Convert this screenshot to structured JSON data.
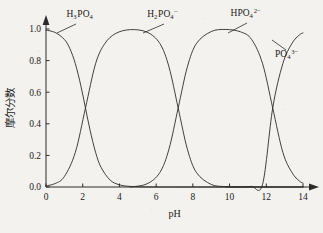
{
  "chart_data": {
    "type": "line",
    "title": "",
    "xlabel": "pH",
    "ylabel": "摩尔分数",
    "xlim": [
      0,
      14
    ],
    "ylim": [
      0.0,
      1.0
    ],
    "xticks": [
      "0",
      "2",
      "4",
      "6",
      "8",
      "10",
      "12",
      "14"
    ],
    "xtick_values": [
      0,
      2,
      4,
      6,
      8,
      10,
      12,
      14
    ],
    "yticks": [
      "0.0",
      "0.2",
      "0.4",
      "0.6",
      "0.8",
      "1.0"
    ],
    "ytick_values": [
      0.0,
      0.2,
      0.4,
      0.6,
      0.8,
      1.0
    ],
    "grid": false,
    "legend": "inline-annotations",
    "pka_values": [
      2.15,
      7.2,
      12.35
    ],
    "series": [
      {
        "name": "H₃PO₄",
        "label_html": "H<sub>3</sub>PO<sub>4</sub>",
        "x": [
          0,
          0.5,
          1.0,
          1.3,
          1.6,
          1.9,
          2.15,
          2.4,
          2.7,
          3.0,
          3.5,
          4.0,
          4.6,
          5.5,
          7.0,
          9.0,
          11.0,
          14.0
        ],
        "y": [
          0.993,
          0.978,
          0.934,
          0.876,
          0.78,
          0.64,
          0.5,
          0.36,
          0.22,
          0.124,
          0.043,
          0.014,
          0.0035,
          0.0004,
          0.0,
          0.0,
          0.0,
          0.0
        ]
      },
      {
        "name": "H₂PO₄⁻",
        "label_html": "H<sub>2</sub>PO<sub>4</sub><sup>−</sup>",
        "x": [
          0,
          0.5,
          1.0,
          1.6,
          2.15,
          2.7,
          3.2,
          3.8,
          4.6,
          5.5,
          6.2,
          6.7,
          7.2,
          7.7,
          8.2,
          9.0,
          9.8,
          10.6,
          11.5,
          12.35,
          13.2,
          14.0
        ],
        "y": [
          0.007,
          0.022,
          0.066,
          0.22,
          0.5,
          0.78,
          0.907,
          0.972,
          0.996,
          0.98,
          0.909,
          0.76,
          0.5,
          0.24,
          0.091,
          0.016,
          0.0025,
          0.0004,
          0.0,
          0.0,
          0.0,
          0.0
        ]
      },
      {
        "name": "HPO₄²⁻",
        "label_html": "HPO<sub>4</sub><sup>2−</sup>",
        "x": [
          4.6,
          5.5,
          6.2,
          6.7,
          7.2,
          7.7,
          8.2,
          9.0,
          9.8,
          10.6,
          11.2,
          11.8,
          12.35,
          12.9,
          13.4,
          13.8,
          14.0
        ],
        "y": [
          0.0,
          0.02,
          0.091,
          0.24,
          0.5,
          0.76,
          0.909,
          0.984,
          0.997,
          0.982,
          0.934,
          0.78,
          0.5,
          0.22,
          0.091,
          0.038,
          0.025
        ]
      },
      {
        "name": "PO₄³⁻",
        "label_html": "PO<sub>4</sub><sup>3−</sup>",
        "x": [
          9.8,
          10.6,
          11.2,
          11.8,
          12.35,
          12.9,
          13.4,
          13.8,
          14.0
        ],
        "y": [
          0.0,
          0.0005,
          0.004,
          0.018,
          0.5,
          0.78,
          0.909,
          0.962,
          0.975
        ]
      }
    ],
    "annotations": [
      {
        "text": "H₃PO₄",
        "x_px": 80,
        "y_px": 17
      },
      {
        "text": "H₂PO₄⁻",
        "x_px": 163,
        "y_px": 17
      },
      {
        "text": "HPO₄²⁻",
        "x_px": 246,
        "y_px": 16
      },
      {
        "text": "PO₄³⁻",
        "x_px": 287,
        "y_px": 57
      }
    ],
    "colors": {
      "curve": "#2b2b2b",
      "axis": "#2b2b2b",
      "text": "#1a1a1a",
      "background": "#f4f2ee"
    }
  }
}
